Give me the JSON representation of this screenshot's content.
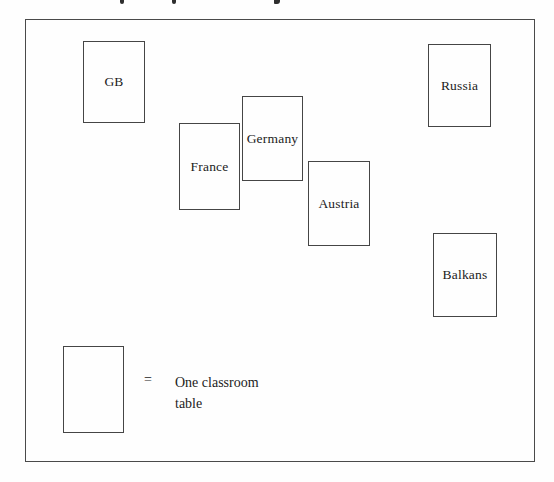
{
  "figure": {
    "colors": {
      "line": "#4a4a4a",
      "text": "#1c1c1c",
      "background": "#fefefe"
    }
  },
  "tables": [
    {
      "label": "GB"
    },
    {
      "label": "France"
    },
    {
      "label": "Germany"
    },
    {
      "label": "Austria"
    },
    {
      "label": "Russia"
    },
    {
      "label": "Balkans"
    }
  ],
  "legend": {
    "equals": "=",
    "line1": "One classroom",
    "line2": "table"
  }
}
